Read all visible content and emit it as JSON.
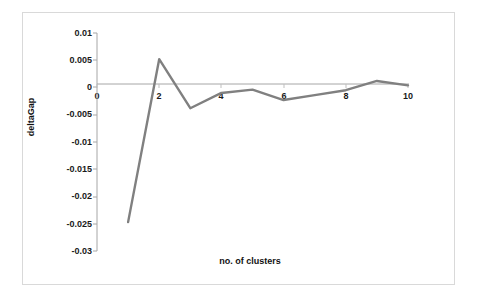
{
  "chart_data": {
    "type": "line",
    "title": "",
    "xlabel": "no. of clusters",
    "ylabel": "deltaGap",
    "x": [
      1,
      2,
      3,
      4,
      5,
      6,
      7,
      8,
      9,
      10
    ],
    "values": [
      -0.0247,
      0.0052,
      -0.0038,
      -0.001,
      -0.0004,
      -0.0023,
      -0.0014,
      -0.0005,
      0.0012,
      0.0004
    ],
    "series": [
      {
        "name": "deltaGap",
        "values": [
          -0.0247,
          0.0052,
          -0.0038,
          -0.001,
          -0.0004,
          -0.0023,
          -0.0014,
          -0.0005,
          0.0012,
          0.0004
        ]
      }
    ],
    "xlim": [
      0,
      10
    ],
    "ylim": [
      -0.03,
      0.01
    ],
    "xticks": [
      0,
      2,
      4,
      6,
      8,
      10
    ],
    "xtick_labels": [
      "0",
      "2",
      "4",
      "6",
      "8",
      "10"
    ],
    "yticks": [
      0.01,
      0.005,
      0,
      -0.005,
      -0.01,
      -0.015,
      -0.02,
      -0.025,
      -0.03
    ],
    "ytick_labels": [
      "0.01",
      "0.005",
      "0",
      "-0.005",
      "-0.01",
      "-0.015",
      "-0.02",
      "-0.025",
      "-0.03"
    ],
    "grid": false,
    "legend": "none",
    "line_color": "#808080",
    "axis_color": "#a6a6a6",
    "border_color": "#d9d9d9",
    "text_color": "#1a1a1a",
    "background_color": "#ffffff"
  },
  "axes": {
    "x_title": "no. of clusters",
    "y_title": "deltaGap"
  },
  "ytick_labels": {
    "t0": "0.01",
    "t1": "0.005",
    "t2": "0",
    "t3": "-0.005",
    "t4": "-0.01",
    "t5": "-0.015",
    "t6": "-0.02",
    "t7": "-0.025",
    "t8": "-0.03"
  },
  "xtick_labels": {
    "t0": "0",
    "t1": "2",
    "t2": "4",
    "t3": "6",
    "t4": "8",
    "t5": "10"
  }
}
